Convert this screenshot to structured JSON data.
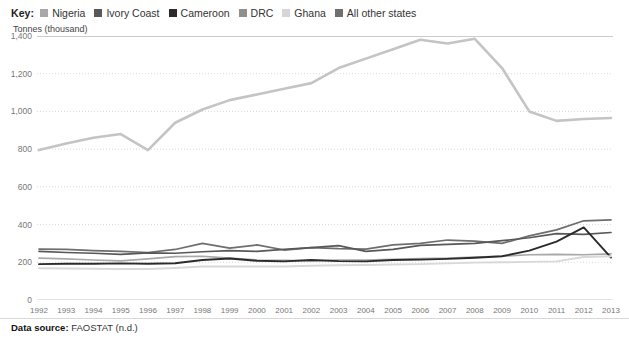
{
  "legend": {
    "key_label": "Key:",
    "items": [
      {
        "label": "Nigeria",
        "color": "#a8a8a8"
      },
      {
        "label": "Ivory Coast",
        "color": "#585858"
      },
      {
        "label": "Cameroon",
        "color": "#2b2b2b"
      },
      {
        "label": "DRC",
        "color": "#8f8f8f"
      },
      {
        "label": "Ghana",
        "color": "#d6d6d6"
      },
      {
        "label": "All other states",
        "color": "#6e6e6e"
      }
    ]
  },
  "axis_title": "Tonnes (thousand)",
  "source": {
    "label": "Data source:",
    "value": "FAOSTAT (n.d.)"
  },
  "chart_data": {
    "type": "line",
    "title": "",
    "xlabel": "",
    "ylabel": "Tonnes (thousand)",
    "ylim": [
      0,
      1400
    ],
    "yticks": [
      0,
      200,
      400,
      600,
      800,
      1000,
      1200,
      1400
    ],
    "ytick_labels": [
      "0",
      "200",
      "400",
      "600",
      "800",
      "1,000",
      "1,200",
      "1,400"
    ],
    "grid": true,
    "legend_position": "top",
    "x": [
      1992,
      1993,
      1994,
      1995,
      1996,
      1997,
      1998,
      1999,
      2000,
      2001,
      2002,
      2003,
      2004,
      2005,
      2006,
      2007,
      2008,
      2009,
      2010,
      2011,
      2012,
      2013
    ],
    "xtick_labels": [
      "1992",
      "1993",
      "1994",
      "1995",
      "1996",
      "1997",
      "1998",
      "1999",
      "2000",
      "2001",
      "2002",
      "2003",
      "2004",
      "2005",
      "2006",
      "2007",
      "2008",
      "2009",
      "2010",
      "2011",
      "2012",
      "2013"
    ],
    "series": [
      {
        "name": "Ivory Coast",
        "color": "#c4c4c4",
        "width": 2.6,
        "values": [
          795,
          830,
          860,
          880,
          795,
          940,
          1010,
          1060,
          1090,
          1120,
          1150,
          1230,
          1280,
          1330,
          1380,
          1360,
          1385,
          1230,
          1000,
          950,
          960,
          965
        ]
      },
      {
        "name": "All other states",
        "color": "#6e6e6e",
        "width": 1.7,
        "values": [
          270,
          268,
          262,
          258,
          252,
          268,
          300,
          275,
          292,
          265,
          278,
          272,
          270,
          292,
          300,
          318,
          312,
          300,
          340,
          372,
          420,
          425
        ]
      },
      {
        "name": "Ivory Coast line (dark)",
        "color": "#585858",
        "width": 1.7,
        "values": [
          258,
          252,
          248,
          242,
          250,
          248,
          256,
          262,
          258,
          268,
          278,
          288,
          258,
          268,
          290,
          295,
          300,
          315,
          330,
          352,
          348,
          358
        ]
      },
      {
        "name": "Nigeria",
        "color": "#a8a8a8",
        "width": 1.7,
        "values": [
          222,
          218,
          212,
          208,
          218,
          230,
          232,
          222,
          212,
          210,
          208,
          212,
          212,
          216,
          220,
          222,
          228,
          232,
          240,
          242,
          240,
          245
        ]
      },
      {
        "name": "Cameroon",
        "color": "#2b2b2b",
        "width": 1.9,
        "values": [
          190,
          192,
          192,
          194,
          192,
          195,
          212,
          220,
          208,
          205,
          212,
          206,
          205,
          212,
          214,
          218,
          224,
          232,
          262,
          310,
          385,
          225
        ]
      },
      {
        "name": "Ghana",
        "color": "#d8d8d8",
        "width": 1.9,
        "values": [
          168,
          167,
          166,
          164,
          164,
          170,
          178,
          178,
          178,
          178,
          182,
          184,
          186,
          188,
          190,
          194,
          198,
          200,
          202,
          205,
          228,
          232
        ]
      }
    ]
  }
}
